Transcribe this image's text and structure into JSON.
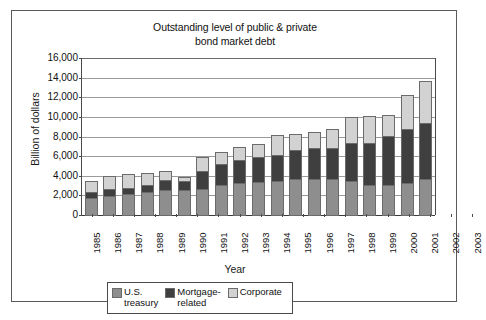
{
  "chart_data": {
    "type": "bar",
    "subtype": "stacked-bar",
    "title": "Outstanding level of public & private bond market debt",
    "title_lines": [
      "Outstanding level of public & private",
      "bond market debt"
    ],
    "xlabel": "Year",
    "ylabel": "Billion of dollars",
    "ylim": [
      0,
      16000
    ],
    "ytick_values": [
      0,
      2000,
      4000,
      6000,
      8000,
      10000,
      12000,
      14000,
      16000
    ],
    "ytick_labels": [
      "0",
      "2,000",
      "4,000",
      "6,000",
      "8,000",
      "10,000",
      "12,000",
      "14,000",
      "16,000"
    ],
    "grid": true,
    "legend_position": "bottom",
    "categories": [
      "1985",
      "1986",
      "1987",
      "1988",
      "1989",
      "1990",
      "1991",
      "1992",
      "1993",
      "1994",
      "1995",
      "1996",
      "1997",
      "1998",
      "1999",
      "2000",
      "2001",
      "2002",
      "2003"
    ],
    "series": [
      {
        "name": "U.S. treasury",
        "name_lines": [
          "U.S.",
          "treasury"
        ],
        "color": "#8e8e8e",
        "values": [
          1600,
          1850,
          2000,
          2200,
          2400,
          2450,
          2550,
          3000,
          3200,
          3300,
          3400,
          3600,
          3600,
          3550,
          3350,
          3000,
          3000,
          3200,
          3600
        ]
      },
      {
        "name": "Mortgage-related",
        "name_lines": [
          "Mortgage-",
          "related"
        ],
        "color": "#3f3f3f",
        "values": [
          550,
          600,
          500,
          700,
          1000,
          800,
          1750,
          2000,
          2200,
          2400,
          2550,
          2800,
          3000,
          3100,
          3800,
          4100,
          4800,
          5400,
          5600
        ]
      },
      {
        "name": "Corporate",
        "color": "#d2d2d2",
        "values": [
          1000,
          1200,
          1350,
          1050,
          750,
          300,
          1300,
          1150,
          1200,
          1250,
          1850,
          1600,
          1600,
          1850,
          2550,
          2700,
          2100,
          3300,
          4150
        ]
      }
    ],
    "totals": [
      3150,
      3650,
      3850,
      3950,
      4150,
      3550,
      5600,
      6150,
      6600,
      6950,
      7800,
      8000,
      8200,
      8500,
      9700,
      9800,
      9900,
      11900,
      13350
    ]
  }
}
